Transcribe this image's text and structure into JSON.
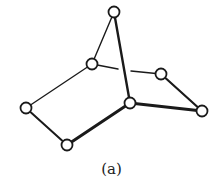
{
  "caption": "(a)",
  "colors": {
    "stroke": "#1a1a1a",
    "node_fill": "#ffffff",
    "background": "#ffffff"
  },
  "nodes": [
    {
      "id": "top",
      "x": 114,
      "y": 12
    },
    {
      "id": "upper-left",
      "x": 92,
      "y": 64
    },
    {
      "id": "right-upper",
      "x": 161,
      "y": 74
    },
    {
      "id": "left",
      "x": 26,
      "y": 108
    },
    {
      "id": "center",
      "x": 130,
      "y": 103
    },
    {
      "id": "right",
      "x": 202,
      "y": 111
    },
    {
      "id": "bottom",
      "x": 67,
      "y": 145
    }
  ],
  "edges": [
    {
      "from": "top",
      "to": "upper-left",
      "weight": "thin"
    },
    {
      "from": "top",
      "to": "center",
      "weight": "thick"
    },
    {
      "from": "upper-left",
      "to": "left",
      "weight": "thin"
    },
    {
      "from": "upper-left",
      "to": "right-upper",
      "weight": "thin",
      "broken": true
    },
    {
      "from": "left",
      "to": "bottom",
      "weight": "medium"
    },
    {
      "from": "bottom",
      "to": "center",
      "weight": "thick"
    },
    {
      "from": "center",
      "to": "right",
      "weight": "thick"
    },
    {
      "from": "right-upper",
      "to": "right",
      "weight": "medium"
    }
  ]
}
